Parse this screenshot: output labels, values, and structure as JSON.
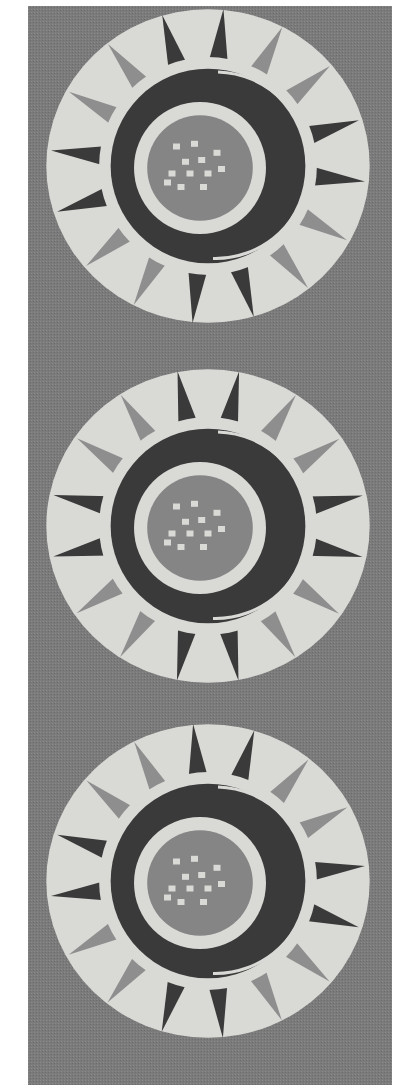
{
  "image": {
    "subject": "woven textile panel with three sun medallions",
    "colors": {
      "background": "#ffffff",
      "fabric": "#7b7b7b",
      "light": "#d9d9d6",
      "mid": "#8e8e8e",
      "dark": "#3a3a3a",
      "center": "#858585"
    },
    "medallions": [
      {
        "cx": 180,
        "cy": 160,
        "r": 165
      },
      {
        "cx": 180,
        "cy": 520,
        "r": 165
      },
      {
        "cx": 180,
        "cy": 875,
        "r": 165
      }
    ],
    "ray_count": 16
  }
}
